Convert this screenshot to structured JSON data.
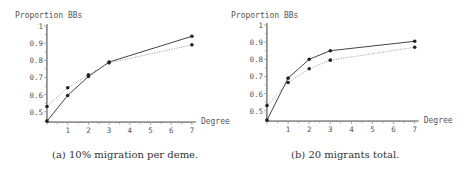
{
  "chart_data": [
    {
      "type": "line",
      "caption": "(a) 10% migration per deme.",
      "title": "",
      "ylabel": "Proportion BBs",
      "xlabel": "Degree",
      "x": [
        0,
        1,
        2,
        3,
        7
      ],
      "xticks": [
        "1",
        "2",
        "3",
        "4",
        "5",
        "6",
        "7"
      ],
      "yticks": [
        "0.5",
        "0.6",
        "0.7",
        "0.8",
        "0.9",
        "1"
      ],
      "xlim": [
        0,
        7
      ],
      "ylim": [
        0.44,
        1.0
      ],
      "grid": false,
      "series": [
        {
          "name": "solid",
          "style": "solid",
          "values": [
            0.445,
            0.595,
            0.705,
            0.79,
            0.94
          ]
        },
        {
          "name": "dotted",
          "style": "dotted",
          "values": [
            0.53,
            0.64,
            0.715,
            0.785,
            0.89
          ]
        }
      ]
    },
    {
      "type": "line",
      "caption": "(b) 20 migrants total.",
      "title": "",
      "ylabel": "Proportion BBs",
      "xlabel": "Degree",
      "x": [
        0,
        1,
        2,
        3,
        7
      ],
      "xticks": [
        "1",
        "2",
        "3",
        "4",
        "5",
        "6",
        "7"
      ],
      "yticks": [
        "0.5",
        "0.6",
        "0.7",
        "0.8",
        "0.9",
        "1"
      ],
      "xlim": [
        0,
        7
      ],
      "ylim": [
        0.44,
        1.0
      ],
      "grid": false,
      "series": [
        {
          "name": "solid",
          "style": "solid",
          "values": [
            0.445,
            0.69,
            0.8,
            0.85,
            0.905
          ]
        },
        {
          "name": "dotted",
          "style": "dotted",
          "values": [
            0.53,
            0.665,
            0.745,
            0.795,
            0.87
          ]
        }
      ]
    }
  ],
  "captions": {
    "a": "(a) 10% migration per deme.",
    "b": "(b) 20 migrants total."
  },
  "labels": {
    "ylabel": "Proportion BBs",
    "xlabel": "Degree"
  }
}
